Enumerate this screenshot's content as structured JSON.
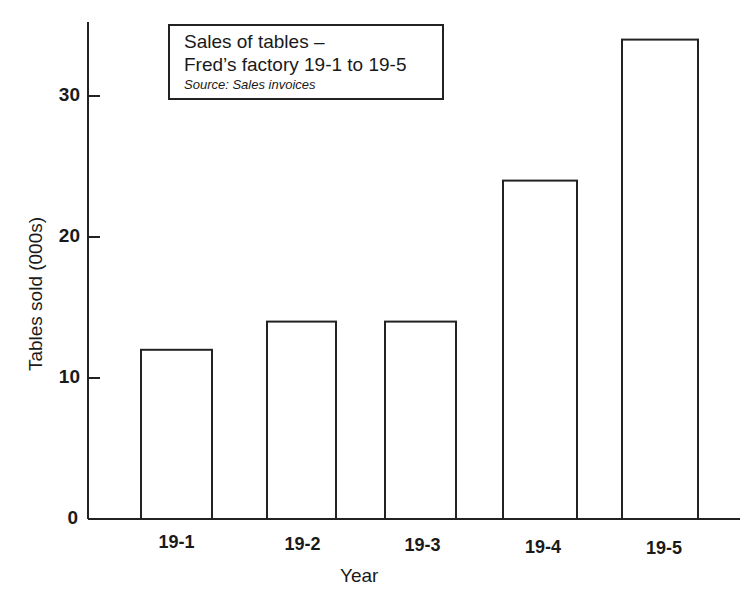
{
  "chart_data": {
    "type": "bar",
    "title": "Sales of tables – Fred’s factory 19-1 to 19-5",
    "title_lines": [
      "Sales of tables –",
      "Fred’s factory 19-1 to 19-5"
    ],
    "subtitle": "Source: Sales invoices",
    "categories": [
      "19-1",
      "19-2",
      "19-3",
      "19-4",
      "19-5"
    ],
    "values": [
      12,
      14,
      14,
      24,
      34
    ],
    "xlabel": "Year",
    "ylabel": "Tables sold (000s)",
    "yticks": [
      "0",
      "10",
      "20",
      "30"
    ],
    "ylim": [
      0,
      35
    ],
    "grid": false,
    "legend": null,
    "bar_fill": "#ffffff",
    "bar_stroke": "#222222"
  }
}
